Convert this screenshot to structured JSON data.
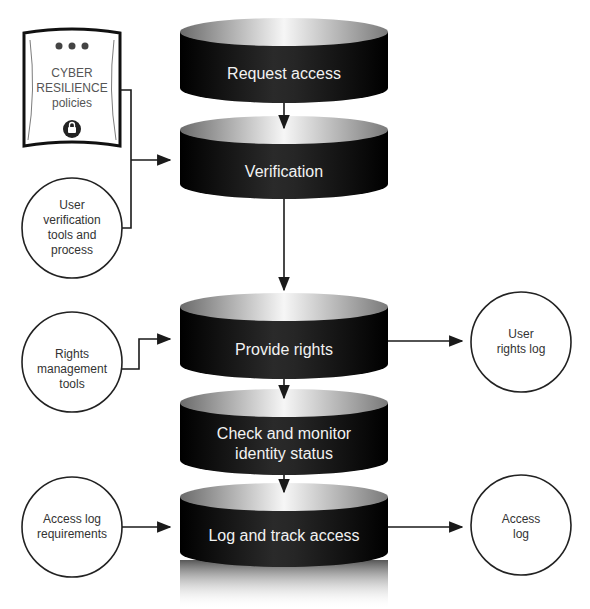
{
  "policy_device": {
    "line1": "CYBER",
    "line2": "RESILIENCE",
    "line3": "policies",
    "icon": "lock-icon"
  },
  "process_steps": [
    {
      "label": "Request access"
    },
    {
      "label": "Verification"
    },
    {
      "label": "Provide rights"
    },
    {
      "label_line1": "Check and monitor",
      "label_line2": "identity status"
    },
    {
      "label": "Log and track access"
    }
  ],
  "inputs": {
    "user_verification": [
      "User",
      "verification",
      "tools and",
      "process"
    ],
    "rights_management": [
      "Rights",
      "management",
      "tools"
    ],
    "access_log_requirements": [
      "Access log",
      "requirements"
    ]
  },
  "outputs": {
    "user_rights_log": [
      "User",
      "rights log"
    ],
    "access_log": [
      "Access",
      "log"
    ]
  },
  "colors": {
    "cylinder_body": "#111111",
    "cylinder_top_light": "#f4f4f4",
    "cylinder_top_dark": "#6a6a6a",
    "line": "#1a1a1a",
    "text_dark": "#333333",
    "text_light": "#f2f2f2"
  }
}
